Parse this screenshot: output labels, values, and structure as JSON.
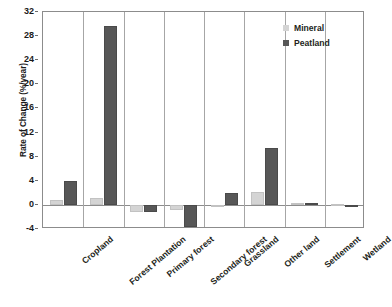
{
  "chart_data": {
    "type": "bar",
    "title": "",
    "xlabel": "",
    "ylabel": "Rate of Change (%/year)",
    "ylim": [
      -4,
      32
    ],
    "yticks": [
      32,
      28,
      24,
      20,
      16,
      12,
      8,
      4,
      0,
      -4
    ],
    "grid": false,
    "legend_position": "top-right",
    "categories": [
      "Cropland",
      "Forest Plantation",
      "Primary forest",
      "Secondary forest",
      "Grassland",
      "Other land",
      "Settlement",
      "Wetland"
    ],
    "series": [
      {
        "name": "Mineral",
        "color": "#d4d4d4",
        "values": [
          0.8,
          1.1,
          -1.2,
          -0.9,
          -0.2,
          2.2,
          0.3,
          0.2
        ]
      },
      {
        "name": "Peatland",
        "color": "#575757",
        "values": [
          4.0,
          29.7,
          -1.2,
          -3.6,
          2.0,
          9.4,
          0.3,
          0.0
        ]
      }
    ]
  },
  "axis": {
    "y_title": "Rate of Change (%/year)",
    "tick_labels": [
      "32",
      "28",
      "24",
      "20",
      "16",
      "12",
      "8",
      "4",
      "0",
      "-4"
    ]
  },
  "legend": {
    "items": [
      {
        "label": "Mineral",
        "color": "#d4d4d4"
      },
      {
        "label": "Peatland",
        "color": "#575757"
      }
    ]
  }
}
